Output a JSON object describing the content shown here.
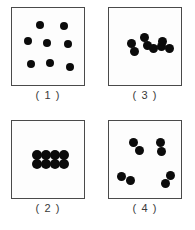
{
  "figure": {
    "title": "",
    "background_color": "#ffffff",
    "dot_color": "#0b0b0b",
    "box_border_color": "#4a4a4a",
    "label_color": "#3a3a3a",
    "panel_count": 4,
    "dots_per_panel": 8,
    "panel_box": {
      "width": 74,
      "height": 79
    }
  },
  "panels": [
    {
      "id": "panel-1",
      "label": "( 1 )",
      "position": "top-left",
      "grouping": "ungrouped",
      "description": "eight evenly scattered separate dots",
      "dot_radius": 4.0,
      "dots": [
        {
          "cx": 28,
          "cy": 17
        },
        {
          "cx": 52,
          "cy": 18
        },
        {
          "cx": 16,
          "cy": 33
        },
        {
          "cx": 35,
          "cy": 35
        },
        {
          "cx": 56,
          "cy": 36
        },
        {
          "cx": 19,
          "cy": 56
        },
        {
          "cx": 38,
          "cy": 55
        },
        {
          "cx": 58,
          "cy": 59
        }
      ]
    },
    {
      "id": "panel-2",
      "label": "( 2 )",
      "position": "bottom-left",
      "grouping": "single-block",
      "description": "eight touching dots in one 2-row by 4-column block",
      "dot_radius": 5.0,
      "dots": [
        {
          "cx": 25,
          "cy": 34
        },
        {
          "cx": 34,
          "cy": 34
        },
        {
          "cx": 43,
          "cy": 34
        },
        {
          "cx": 52,
          "cy": 34
        },
        {
          "cx": 25,
          "cy": 43
        },
        {
          "cx": 34,
          "cy": 43
        },
        {
          "cx": 43,
          "cy": 43
        },
        {
          "cx": 52,
          "cy": 43
        }
      ]
    },
    {
      "id": "panel-3",
      "label": "( 3 )",
      "position": "top-right",
      "grouping": "four-pairs-clustered",
      "description": "four touching pairs bunched together near the centre",
      "dot_radius": 4.5,
      "dots": [
        {
          "cx": 22,
          "cy": 35
        },
        {
          "cx": 25,
          "cy": 43
        },
        {
          "cx": 35,
          "cy": 29
        },
        {
          "cx": 38,
          "cy": 37
        },
        {
          "cx": 44,
          "cy": 40
        },
        {
          "cx": 52,
          "cy": 38
        },
        {
          "cx": 53,
          "cy": 33
        },
        {
          "cx": 60,
          "cy": 40
        }
      ]
    },
    {
      "id": "panel-4",
      "label": "( 4 )",
      "position": "bottom-right",
      "grouping": "four-pairs-spread",
      "description": "four touching pairs spread to the four corners",
      "dot_radius": 4.5,
      "dots": [
        {
          "cx": 24,
          "cy": 21
        },
        {
          "cx": 30,
          "cy": 29
        },
        {
          "cx": 51,
          "cy": 21
        },
        {
          "cx": 52,
          "cy": 30
        },
        {
          "cx": 12,
          "cy": 55
        },
        {
          "cx": 21,
          "cy": 59
        },
        {
          "cx": 61,
          "cy": 54
        },
        {
          "cx": 56,
          "cy": 62
        }
      ]
    }
  ]
}
